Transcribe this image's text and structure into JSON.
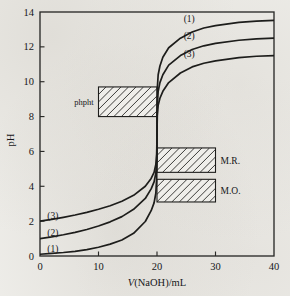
{
  "chart_data": {
    "type": "line",
    "title": "",
    "xlabel": "V(NaOH)/mL",
    "ylabel": "pH",
    "xlim": [
      0,
      40
    ],
    "ylim": [
      0,
      14
    ],
    "xticks": [
      "0",
      "10",
      "20",
      "30",
      "40"
    ],
    "xtick_values": [
      0,
      10,
      20,
      30,
      40
    ],
    "yticks": [
      "0",
      "2",
      "4",
      "6",
      "8",
      "10",
      "12",
      "14"
    ],
    "ytick_values": [
      0,
      2,
      4,
      6,
      8,
      10,
      12,
      14
    ],
    "grid": false,
    "legend_position": "inline-curve-labels",
    "equivalence_volume": 20,
    "series": [
      {
        "name": "(1)",
        "label_left": "(1)",
        "label_right": "(1)",
        "start_ph": 0.1,
        "equivalence_ph": 7.0,
        "end_ph": 13.5,
        "points": [
          [
            0,
            0.1
          ],
          [
            2,
            0.15
          ],
          [
            4,
            0.2
          ],
          [
            6,
            0.27
          ],
          [
            8,
            0.37
          ],
          [
            10,
            0.5
          ],
          [
            12,
            0.68
          ],
          [
            14,
            0.92
          ],
          [
            16,
            1.3
          ],
          [
            18,
            1.98
          ],
          [
            19,
            2.6
          ],
          [
            19.5,
            3.05
          ],
          [
            19.8,
            3.6
          ],
          [
            19.95,
            4.5
          ],
          [
            20,
            7.0
          ],
          [
            20.05,
            9.6
          ],
          [
            20.2,
            10.4
          ],
          [
            20.5,
            10.9
          ],
          [
            21,
            11.4
          ],
          [
            22,
            11.95
          ],
          [
            24,
            12.5
          ],
          [
            26,
            12.85
          ],
          [
            28,
            13.08
          ],
          [
            30,
            13.22
          ],
          [
            34,
            13.4
          ],
          [
            37,
            13.48
          ],
          [
            40,
            13.52
          ]
        ]
      },
      {
        "name": "(2)",
        "label_left": "(2)",
        "label_right": "(2)",
        "start_ph": 1.0,
        "equivalence_ph": 7.0,
        "end_ph": 12.5,
        "points": [
          [
            0,
            1.0
          ],
          [
            2,
            1.1
          ],
          [
            4,
            1.22
          ],
          [
            6,
            1.36
          ],
          [
            8,
            1.52
          ],
          [
            10,
            1.72
          ],
          [
            12,
            1.96
          ],
          [
            14,
            2.26
          ],
          [
            16,
            2.68
          ],
          [
            18,
            3.3
          ],
          [
            19,
            3.85
          ],
          [
            19.5,
            4.25
          ],
          [
            19.8,
            4.75
          ],
          [
            19.95,
            5.4
          ],
          [
            20,
            7.0
          ],
          [
            20.05,
            8.7
          ],
          [
            20.2,
            9.45
          ],
          [
            20.5,
            9.95
          ],
          [
            21,
            10.4
          ],
          [
            22,
            10.95
          ],
          [
            24,
            11.5
          ],
          [
            26,
            11.85
          ],
          [
            28,
            12.06
          ],
          [
            30,
            12.2
          ],
          [
            34,
            12.38
          ],
          [
            37,
            12.46
          ],
          [
            40,
            12.5
          ]
        ]
      },
      {
        "name": "(3)",
        "label_left": "(3)",
        "label_right": "(3)",
        "start_ph": 2.0,
        "equivalence_ph": 7.0,
        "end_ph": 11.5,
        "points": [
          [
            0,
            2.0
          ],
          [
            2,
            2.1
          ],
          [
            4,
            2.22
          ],
          [
            6,
            2.35
          ],
          [
            8,
            2.5
          ],
          [
            10,
            2.68
          ],
          [
            12,
            2.88
          ],
          [
            14,
            3.14
          ],
          [
            16,
            3.48
          ],
          [
            18,
            4.0
          ],
          [
            19,
            4.45
          ],
          [
            19.5,
            4.8
          ],
          [
            19.8,
            5.25
          ],
          [
            19.95,
            5.85
          ],
          [
            20,
            7.0
          ],
          [
            20.05,
            8.05
          ],
          [
            20.2,
            8.65
          ],
          [
            20.5,
            9.05
          ],
          [
            21,
            9.45
          ],
          [
            22,
            9.95
          ],
          [
            24,
            10.5
          ],
          [
            26,
            10.85
          ],
          [
            28,
            11.06
          ],
          [
            30,
            11.2
          ],
          [
            34,
            11.38
          ],
          [
            37,
            11.46
          ],
          [
            40,
            11.5
          ]
        ]
      }
    ],
    "indicator_bands": [
      {
        "label": "phpht",
        "label_side": "left",
        "ph_low": 8.0,
        "ph_high": 9.7,
        "x_start": 10,
        "x_end": 20,
        "hatched": true
      },
      {
        "label": "M.R.",
        "label_side": "right",
        "ph_low": 4.8,
        "ph_high": 6.2,
        "x_start": 20,
        "x_end": 30,
        "hatched": true
      },
      {
        "label": "M.O.",
        "label_side": "right",
        "ph_low": 3.1,
        "ph_high": 4.4,
        "x_start": 20,
        "x_end": 30,
        "hatched": true
      }
    ],
    "colors": {
      "ink": "#1d1d1b",
      "axis": "#2a2a28",
      "paper": "#efeeea"
    }
  }
}
